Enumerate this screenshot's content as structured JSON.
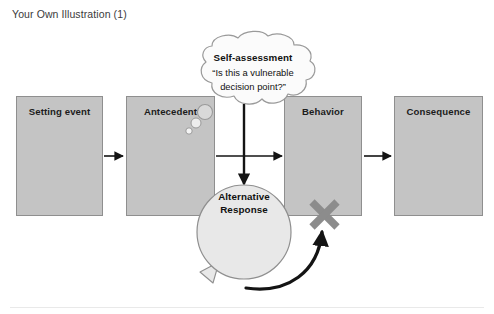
{
  "page": {
    "title": "Your Own Illustration (1)"
  },
  "diagram": {
    "boxes": [
      {
        "id": "setting-event",
        "label": "Setting event"
      },
      {
        "id": "antecedent",
        "label": "Antecedent"
      },
      {
        "id": "behavior",
        "label": "Behavior"
      },
      {
        "id": "consequence",
        "label": "Consequence"
      }
    ],
    "thought_bubble": {
      "title": "Self-assessment",
      "quote_line1": "“Is this a vulnerable",
      "quote_line2": "decision point?”"
    },
    "speech_bubble": {
      "line1": "Alternative",
      "line2": "Response"
    },
    "marks": {
      "cross_label": "X"
    },
    "colors": {
      "box_fill": "#c4c4c4",
      "box_stroke": "#8f8f8f",
      "bubble_fill": "#e8e8e8",
      "bubble_stroke": "#8f8f8f",
      "thought_fill": "#fbfbfb",
      "arrow": "#141414",
      "cross": "#8c8c8c",
      "title_text": "#3a3a3a"
    }
  }
}
